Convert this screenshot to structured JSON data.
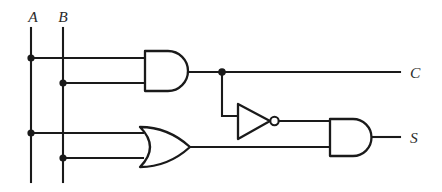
{
  "diagram": {
    "background_color": "#ffffff",
    "line_color": "#1a1a1a",
    "label_color": "#2b2b2b",
    "inputs": [
      {
        "id": "A",
        "label": "A",
        "label_x": 33,
        "label_y": 22,
        "line_x": 31,
        "line_top": 28,
        "line_bottom": 182
      },
      {
        "id": "B",
        "label": "B",
        "label_x": 62,
        "label_y": 22,
        "line_x": 63,
        "line_top": 28,
        "line_bottom": 182
      }
    ],
    "outputs": [
      {
        "id": "C",
        "label": "C",
        "label_x": 410,
        "label_y": 78,
        "line_y": 72,
        "line_from": 222,
        "line_to": 400
      },
      {
        "id": "S",
        "label": "S",
        "label_x": 410,
        "label_y": 143,
        "line_y": 137,
        "line_from": 372,
        "line_to": 400
      }
    ],
    "gates": [
      {
        "id": "and1",
        "type": "AND",
        "x": 145,
        "y": 51,
        "width": 43,
        "height": 40,
        "output_label": "C"
      },
      {
        "id": "or1",
        "type": "OR",
        "x": 140,
        "y": 127,
        "width": 50,
        "height": 40,
        "output_label": ""
      },
      {
        "id": "not1",
        "type": "NOT",
        "x": 238,
        "y": 104,
        "width": 34,
        "height": 35,
        "bubble_radius": 4,
        "output_label": ""
      },
      {
        "id": "and2",
        "type": "AND",
        "x": 330,
        "y": 119,
        "width": 42,
        "height": 37,
        "output_label": "S"
      }
    ],
    "junctions": [
      {
        "id": "a-to-and1",
        "x": 31,
        "y": 58,
        "r": 3.6
      },
      {
        "id": "b-to-and1",
        "x": 63,
        "y": 83,
        "r": 3.6
      },
      {
        "id": "a-to-or1",
        "x": 31,
        "y": 133,
        "r": 3.6
      },
      {
        "id": "b-to-or1",
        "x": 63,
        "y": 158,
        "r": 3.6
      },
      {
        "id": "carry-tap",
        "x": 222,
        "y": 72,
        "r": 3.8
      }
    ],
    "wires": [
      {
        "id": "a-and1-input",
        "path": "M31 58 H145"
      },
      {
        "id": "b-and1-input",
        "path": "M63 83 H145"
      },
      {
        "id": "and1-output",
        "path": "M188 72 H400"
      },
      {
        "id": "a-or1-input",
        "path": "M31 133 H142"
      },
      {
        "id": "b-or1-input",
        "path": "M63 158 H142"
      },
      {
        "id": "carry-drop",
        "path": "M222 72 V116 H238"
      },
      {
        "id": "not1-output",
        "path": "M279 121 H330"
      },
      {
        "id": "or1-to-and2",
        "path": "M190 147 H330"
      },
      {
        "id": "and2-output",
        "path": "M372 137 H400"
      }
    ],
    "logic": {
      "carry_expression": "C = A AND B",
      "sum_expression": "S = (A OR B) AND NOT(A AND B)"
    }
  }
}
